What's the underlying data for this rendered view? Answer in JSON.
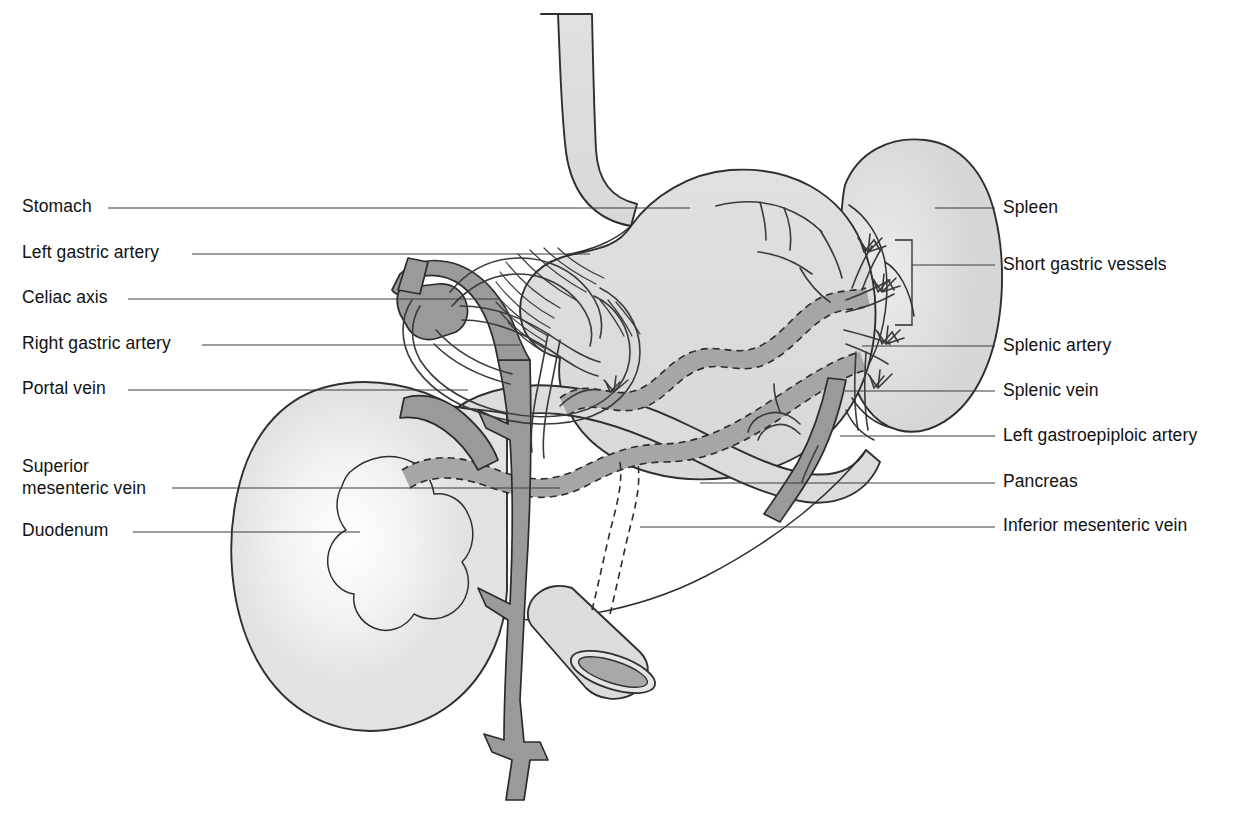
{
  "figure": {
    "colors": {
      "background": "#ffffff",
      "organ_fill": "#dcdcdc",
      "organ_fill_light": "#e8e8e8",
      "organ_fill_pale": "#f2f2f2",
      "vessel_fill": "#9a9a9a",
      "vessel_fill_dark": "#8a8a8a",
      "outline": "#2f2f2f",
      "leader_line": "#3a3a3a",
      "text": "#111111"
    }
  },
  "labels_left": [
    {
      "id": "stomach",
      "text": "Stomach",
      "x": 22,
      "y": 212,
      "leader_x1": 108,
      "leader_x2": 690,
      "leader_y": 208
    },
    {
      "id": "left-gastric-artery",
      "text": "Left gastric artery",
      "x": 22,
      "y": 258,
      "leader_x1": 192,
      "leader_x2": 590,
      "leader_y": 254
    },
    {
      "id": "celiac-axis",
      "text": "Celiac axis",
      "x": 22,
      "y": 303,
      "leader_x1": 128,
      "leader_x2": 500,
      "leader_y": 299
    },
    {
      "id": "right-gastric-artery",
      "text": "Right gastric artery",
      "x": 22,
      "y": 349,
      "leader_x1": 202,
      "leader_x2": 520,
      "leader_y": 345
    },
    {
      "id": "portal-vein",
      "text": "Portal vein",
      "x": 22,
      "y": 394,
      "leader_x1": 128,
      "leader_x2": 468,
      "leader_y": 390
    },
    {
      "id": "superior-mesenteric-vein",
      "text": "Superior",
      "text2": "mesenteric vein",
      "x": 22,
      "y": 472,
      "y2": 494,
      "leader_x1": 172,
      "leader_x2": 560,
      "leader_y": 488
    },
    {
      "id": "duodenum",
      "text": "Duodenum",
      "x": 22,
      "y": 536,
      "leader_x1": 133,
      "leader_x2": 360,
      "leader_y": 532
    }
  ],
  "labels_right": [
    {
      "id": "spleen",
      "text": "Spleen",
      "x": 1003,
      "y": 213,
      "leader_x1": 935,
      "leader_x2": 995,
      "leader_y": 208
    },
    {
      "id": "short-gastric-vessels",
      "text": "Short gastric vessels",
      "x": 1003,
      "y": 270,
      "leader_x1": 912,
      "leader_x2": 995,
      "leader_y": 265
    },
    {
      "id": "splenic-artery",
      "text": "Splenic artery",
      "x": 1003,
      "y": 351,
      "leader_x1": 862,
      "leader_x2": 995,
      "leader_y": 346
    },
    {
      "id": "splenic-vein",
      "text": "Splenic vein",
      "x": 1003,
      "y": 396,
      "leader_x1": 845,
      "leader_x2": 995,
      "leader_y": 391
    },
    {
      "id": "left-gastroepiploic-artery",
      "text": "Left gastroepiploic artery",
      "x": 1003,
      "y": 441,
      "leader_x1": 840,
      "leader_x2": 995,
      "leader_y": 436
    },
    {
      "id": "pancreas",
      "text": "Pancreas",
      "x": 1003,
      "y": 487,
      "leader_x1": 700,
      "leader_x2": 995,
      "leader_y": 483
    },
    {
      "id": "inferior-mesenteric-vein",
      "text": "Inferior mesenteric vein",
      "x": 1003,
      "y": 531,
      "leader_x1": 640,
      "leader_x2": 995,
      "leader_y": 527
    }
  ],
  "structures": [
    {
      "id": "esophagus",
      "name": "Esophagus"
    },
    {
      "id": "stomach-body",
      "name": "Stomach"
    },
    {
      "id": "spleen-body",
      "name": "Spleen"
    },
    {
      "id": "pancreas-body",
      "name": "Pancreas"
    },
    {
      "id": "duodenum-loop",
      "name": "Duodenum"
    },
    {
      "id": "celiac-trunk",
      "name": "Celiac axis"
    },
    {
      "id": "splenic-artery-vessel",
      "name": "Splenic artery"
    },
    {
      "id": "splenic-vein-vessel",
      "name": "Splenic vein"
    },
    {
      "id": "portal-vein-vessel",
      "name": "Portal vein"
    },
    {
      "id": "superior-mesenteric-vein-vessel",
      "name": "Superior mesenteric vein"
    },
    {
      "id": "inferior-mesenteric-vein-vessel",
      "name": "Inferior mesenteric vein"
    },
    {
      "id": "left-gastric-artery-vessel",
      "name": "Left gastric artery"
    },
    {
      "id": "right-gastric-artery-vessel",
      "name": "Right gastric artery"
    },
    {
      "id": "left-gastroepiploic-artery-vessel",
      "name": "Left gastroepiploic artery"
    },
    {
      "id": "short-gastric-vessels-group",
      "name": "Short gastric vessels"
    }
  ]
}
